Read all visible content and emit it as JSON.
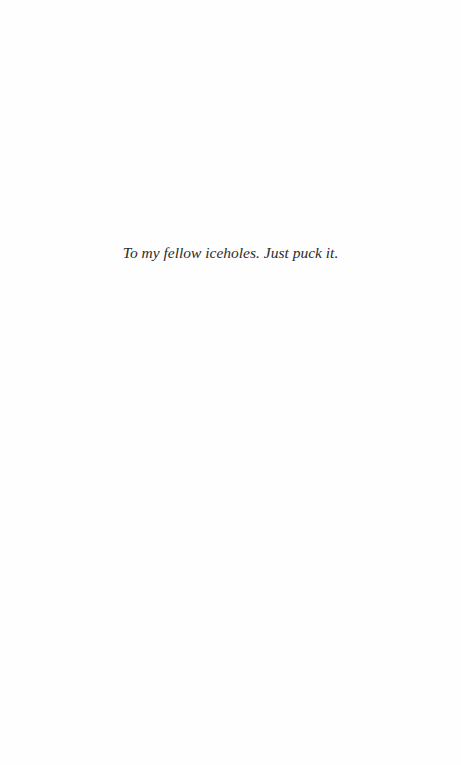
{
  "page": {
    "type": "dedication",
    "background": "#fefefe",
    "text_color": "#2b2b2b",
    "dedication_text": "To my fellow iceholes. Just puck it."
  }
}
